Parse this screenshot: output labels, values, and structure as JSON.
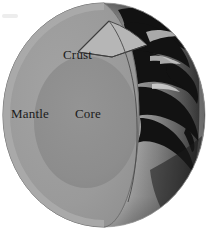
{
  "figure": {
    "type": "cross-section-illustration",
    "width": 211,
    "height": 231,
    "background_color": "#ffffff"
  },
  "labels": {
    "crust": "Crust",
    "mantle": "Mantle",
    "core": "Core"
  },
  "layers": [
    {
      "name": "crust",
      "label": "Crust",
      "color": "#b4b4b4",
      "description": "thin outer wedge slice at upper right of the cut"
    },
    {
      "name": "mantle",
      "label": "Mantle",
      "color": "#9a9a9a",
      "description": "large mid-gray region filling most of the cut hemisphere"
    },
    {
      "name": "core",
      "label": "Core",
      "color": "#8e8e8e",
      "description": "darker central ellipse"
    },
    {
      "name": "cut-face",
      "label": "",
      "color": "#c9c9c9",
      "description": "light gray flat slice face on the right of the cutaway"
    },
    {
      "name": "globe-surface",
      "label": "",
      "color": "#7a7a7a",
      "description": "photographic globe limb showing continents in dark silhouette"
    }
  ],
  "colors": {
    "background": "#ffffff",
    "outline": "#3a3a3a",
    "mantle": "#9a9a9a",
    "core": "#8e8e8e",
    "crust_wedge": "#b4b4b4",
    "cut_face": "#c9c9c9",
    "globe_ocean_light": "#d8d8d8",
    "globe_ocean_mid": "#8f8f8f",
    "globe_shadow": "#2a2a2a",
    "continent": "#151515",
    "label_text": "#1a1a1a",
    "smudge": "#ededed"
  }
}
